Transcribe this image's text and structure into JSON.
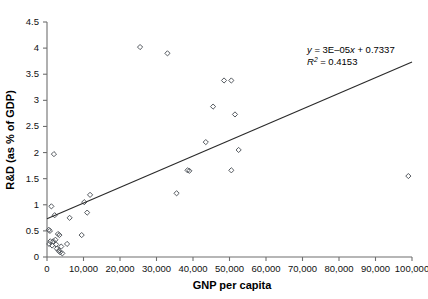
{
  "chart_data": {
    "type": "scatter",
    "title": "",
    "xlabel": "GNP per capita",
    "ylabel": "R&D (as % of GDP)",
    "xlim": [
      0,
      100000
    ],
    "ylim": [
      0,
      4.5
    ],
    "xticks": [
      0,
      10000,
      20000,
      30000,
      40000,
      50000,
      60000,
      70000,
      80000,
      90000,
      100000
    ],
    "xticklabels": [
      "0",
      "10,000",
      "20,000",
      "30,000",
      "40,000",
      "50,000",
      "60,000",
      "70,000",
      "80,000",
      "90,000",
      "100,000"
    ],
    "yticks": [
      0,
      0.5,
      1,
      1.5,
      2,
      2.5,
      3,
      3.5,
      4,
      4.5
    ],
    "yticklabels": [
      "0",
      "0.5",
      "1",
      "1.5",
      "2",
      "2.5",
      "3",
      "3.5",
      "4",
      "4.5"
    ],
    "grid": false,
    "legend": null,
    "marker": "open-diamond",
    "points": [
      {
        "x": 500,
        "y": 0.52
      },
      {
        "x": 600,
        "y": 0.25
      },
      {
        "x": 800,
        "y": 0.5
      },
      {
        "x": 900,
        "y": 0.3
      },
      {
        "x": 1200,
        "y": 0.97
      },
      {
        "x": 1400,
        "y": 0.22
      },
      {
        "x": 1700,
        "y": 0.3
      },
      {
        "x": 1900,
        "y": 1.97
      },
      {
        "x": 2100,
        "y": 0.8
      },
      {
        "x": 2300,
        "y": 0.33
      },
      {
        "x": 2500,
        "y": 0.24
      },
      {
        "x": 2700,
        "y": 0.16
      },
      {
        "x": 3000,
        "y": 0.44
      },
      {
        "x": 3200,
        "y": 0.12
      },
      {
        "x": 3400,
        "y": 0.42
      },
      {
        "x": 3600,
        "y": 0.09
      },
      {
        "x": 3900,
        "y": 0.2
      },
      {
        "x": 4200,
        "y": 0.07
      },
      {
        "x": 5500,
        "y": 0.25
      },
      {
        "x": 6200,
        "y": 0.75
      },
      {
        "x": 9500,
        "y": 0.42
      },
      {
        "x": 10200,
        "y": 1.05
      },
      {
        "x": 11000,
        "y": 0.85
      },
      {
        "x": 11800,
        "y": 1.19
      },
      {
        "x": 25500,
        "y": 4.02
      },
      {
        "x": 33000,
        "y": 3.9
      },
      {
        "x": 35500,
        "y": 1.22
      },
      {
        "x": 38500,
        "y": 1.66
      },
      {
        "x": 39000,
        "y": 1.65
      },
      {
        "x": 43500,
        "y": 2.2
      },
      {
        "x": 45500,
        "y": 2.88
      },
      {
        "x": 48500,
        "y": 3.38
      },
      {
        "x": 50500,
        "y": 3.38
      },
      {
        "x": 50500,
        "y": 1.66
      },
      {
        "x": 51500,
        "y": 2.73
      },
      {
        "x": 52500,
        "y": 2.05
      },
      {
        "x": 99000,
        "y": 1.55
      }
    ],
    "trendline": {
      "equation_y": "y",
      "equation_rest": " = 3E–05",
      "equation_x": "x",
      "equation_tail": " + 0.7337",
      "equation_full": "y = 3E–05x + 0.7337",
      "r2_symbol": "R",
      "r2_sup": "2",
      "r2_value": " = 0.4153",
      "r2_full": "R² = 0.4153",
      "slope": 3e-05,
      "intercept": 0.7337,
      "r_squared": 0.4153,
      "x_start": 0,
      "x_end": 100000
    }
  },
  "colors": {
    "marker_stroke": "#555a60",
    "trendline": "#2b2b2b",
    "axis": "#6f6f6f",
    "text": "#111111",
    "background": "#ffffff"
  }
}
